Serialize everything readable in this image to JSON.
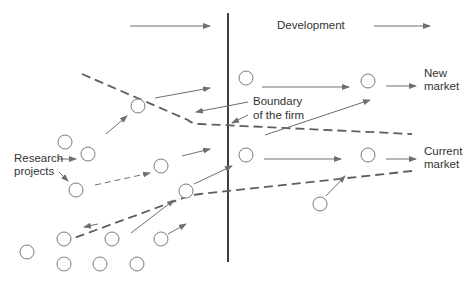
{
  "diagram": {
    "labels": {
      "development": "Development",
      "new_market_1": "New",
      "new_market_2": "market",
      "current_market_1": "Current",
      "current_market_2": "market",
      "research_1": "Research",
      "research_2": "projects",
      "boundary_1": "Boundary",
      "boundary_2": "of the firm"
    },
    "colors": {
      "line": "#6f6f6f",
      "dashed": "#5e5e5e",
      "divider": "#2a2a2a",
      "text": "#333333",
      "background": "#ffffff"
    },
    "nodes": [
      {
        "id": "r1",
        "cx": 65,
        "cy": 142
      },
      {
        "id": "r2",
        "cx": 88,
        "cy": 154
      },
      {
        "id": "r3",
        "cx": 138,
        "cy": 106
      },
      {
        "id": "r4",
        "cx": 76,
        "cy": 190
      },
      {
        "id": "r5",
        "cx": 161,
        "cy": 166
      },
      {
        "id": "r6",
        "cx": 186,
        "cy": 191
      },
      {
        "id": "d1",
        "cx": 246,
        "cy": 78
      },
      {
        "id": "d2",
        "cx": 368,
        "cy": 81
      },
      {
        "id": "d3",
        "cx": 246,
        "cy": 155
      },
      {
        "id": "d4",
        "cx": 368,
        "cy": 155
      },
      {
        "id": "d5",
        "cx": 320,
        "cy": 204
      },
      {
        "id": "b1",
        "cx": 64,
        "cy": 239
      },
      {
        "id": "b2",
        "cx": 112,
        "cy": 239
      },
      {
        "id": "b3",
        "cx": 161,
        "cy": 239
      },
      {
        "id": "b4",
        "cx": 27,
        "cy": 252
      },
      {
        "id": "b5",
        "cx": 64,
        "cy": 264
      },
      {
        "id": "b6",
        "cx": 100,
        "cy": 264
      },
      {
        "id": "b7",
        "cx": 137,
        "cy": 264
      }
    ]
  }
}
